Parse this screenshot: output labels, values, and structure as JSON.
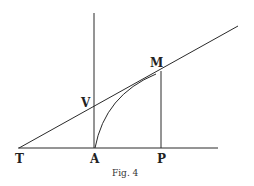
{
  "figure": {
    "caption": "Fig. 4",
    "labels": {
      "T": "T",
      "A": "A",
      "P": "P",
      "M": "M",
      "V": "V"
    },
    "geometry": {
      "baseline": {
        "x1": 18,
        "y1": 148,
        "x2": 218,
        "y2": 148
      },
      "axis_vertical_A": {
        "x1": 94,
        "y1": 13,
        "x2": 94,
        "y2": 148
      },
      "ordinate_MP": {
        "x1": 161,
        "y1": 71,
        "x2": 161,
        "y2": 148
      },
      "tangent_TM": {
        "x1": 19,
        "y1": 148,
        "x2": 238,
        "y2": 26
      },
      "curve_AM": "M95,148 Q105,95 156,74"
    },
    "colors": {
      "stroke": "#2a2a2a",
      "background": "#ffffff"
    }
  }
}
